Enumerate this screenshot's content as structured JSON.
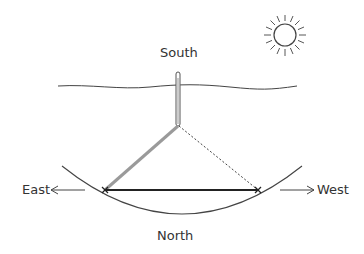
{
  "diagram": {
    "title": "",
    "labels": {
      "south": "South",
      "north": "North",
      "east": "East",
      "west": "West"
    },
    "elements": [
      {
        "name": "sun",
        "description": "sun with rays, upper right"
      },
      {
        "name": "horizon",
        "description": "wavy horizontal line"
      },
      {
        "name": "stick",
        "description": "vertical stick crossing the horizon line"
      },
      {
        "name": "shadow",
        "description": "gray thick line from stick base toward east mark"
      },
      {
        "name": "dotted-line",
        "description": "dotted line from stick base toward west mark"
      },
      {
        "name": "east-west-line",
        "description": "thick black line joining the two marks"
      },
      {
        "name": "arc",
        "description": "curved path traced by shadow tip"
      },
      {
        "name": "east-arrow",
        "description": "arrow pointing left toward East"
      },
      {
        "name": "west-arrow",
        "description": "arrow pointing right toward West"
      }
    ],
    "colors": {
      "line": "#333333",
      "shadow": "#9a9a9a",
      "text": "#333333"
    }
  }
}
